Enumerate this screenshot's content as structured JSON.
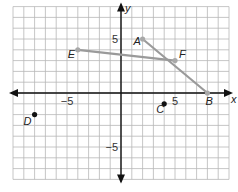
{
  "graph": {
    "x_range": [
      -10,
      10
    ],
    "y_range": [
      -8,
      8
    ],
    "origin_px": [
      121,
      93
    ],
    "unit_px": 10.8,
    "axis_labels": {
      "x": "x",
      "y": "y"
    },
    "tick_labels": [
      {
        "axis": "x",
        "value": -5,
        "text": "−5"
      },
      {
        "axis": "x",
        "value": 5,
        "text": "5"
      },
      {
        "axis": "y",
        "value": 5,
        "text": "5"
      },
      {
        "axis": "y",
        "value": -5,
        "text": "−5"
      }
    ],
    "colors": {
      "grid": "#b8b8b8",
      "axis": "#111111",
      "segment": "#9a9a9a",
      "point": "#111111",
      "segment_point": "#a8a8a8"
    }
  },
  "points": [
    {
      "name": "A",
      "x": 2,
      "y": 5,
      "on_segment": true
    },
    {
      "name": "B",
      "x": 8,
      "y": 0,
      "on_segment": true
    },
    {
      "name": "C",
      "x": 4,
      "y": -1,
      "on_segment": false
    },
    {
      "name": "D",
      "x": -8,
      "y": -2,
      "on_segment": false
    },
    {
      "name": "E",
      "x": -4,
      "y": 4,
      "on_segment": true
    },
    {
      "name": "F",
      "x": 5,
      "y": 3,
      "on_segment": true
    }
  ],
  "segments": [
    {
      "from": "A",
      "to": "B"
    },
    {
      "from": "E",
      "to": "F"
    }
  ]
}
